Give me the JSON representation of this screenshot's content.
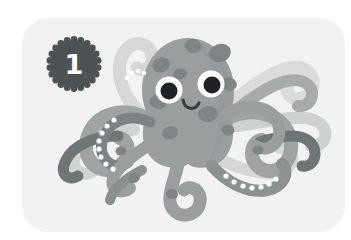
{
  "scene": {
    "type": "illustration-card",
    "background_color": "#ffffff",
    "description": "Cartoon grey octopus illustration on a light grey rounded card with a numbered badge"
  },
  "card": {
    "background_color": "#f1f2f1",
    "corner_radius_px": 26,
    "width_px": 323,
    "height_px": 214
  },
  "badge": {
    "number": "1",
    "shape": "scalloped-circle",
    "fill_color": "#4d5355",
    "text_color": "#ffffff",
    "points": 22
  },
  "watermark": {
    "text": ""
  },
  "illustration": {
    "subject": "octopus",
    "icon_name": "octopus-illustration",
    "colors": {
      "body": "#9a9e9e",
      "body_shade": "#8e9393",
      "spots": "#7d8384",
      "tentacle_dark": "#6f7678",
      "tentacle_mid": "#9a9e9e",
      "tentacle_light": "#c5c9c8",
      "tentacle_pale": "#d9dcda",
      "eye_white": "#ffffff",
      "pupil": "#1e2224",
      "mouth": "#3a3f41",
      "sucker": "#fdfdfd"
    },
    "features": {
      "eyes": 2,
      "mouth": "smile",
      "tentacles": 8,
      "head_spots": 7,
      "sucker_rows": 3
    }
  }
}
